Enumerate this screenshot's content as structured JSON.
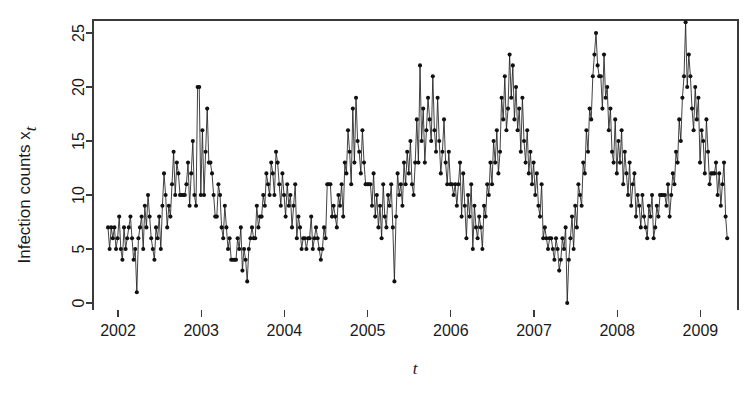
{
  "chart_data": {
    "type": "line",
    "title": "",
    "subtitle": "",
    "xlabel": "t",
    "ylabel": "Infection counts  x",
    "ylabel_subscript": "t",
    "xlim": [
      2002.0,
      2009.05
    ],
    "ylim": [
      0,
      26.5
    ],
    "xticks": [
      2002,
      2003,
      2004,
      2005,
      2006,
      2007,
      2008,
      2009
    ],
    "xticklabels": [
      "2002",
      "2003",
      "2004",
      "2005",
      "2006",
      "2007",
      "2008",
      "2009"
    ],
    "yticks": [
      0,
      5,
      10,
      15,
      20,
      25
    ],
    "yticklabels": [
      "0",
      "5",
      "10",
      "15",
      "20",
      "25"
    ],
    "grid": false,
    "legend": null,
    "marker": "filled-circle",
    "marker_size": 4.1,
    "line_color": "#202020",
    "point_color": "#111111",
    "axis_color": "#3a3a3a",
    "background": "#ffffff",
    "frame": "box",
    "x_start": 2001.88,
    "x_step": 0.019230769,
    "n_points": 371,
    "series": [
      {
        "name": "Infection counts",
        "values": [
          7,
          5,
          7,
          6,
          7,
          5,
          6,
          8,
          5,
          4,
          7,
          5,
          6,
          7,
          8,
          6,
          4,
          5,
          1,
          6,
          7,
          8,
          5,
          9,
          7,
          10,
          8,
          6,
          5,
          4,
          7,
          6,
          8,
          5,
          9,
          12,
          10,
          7,
          9,
          8,
          11,
          14,
          10,
          13,
          12,
          10,
          10,
          10,
          10,
          11,
          13,
          9,
          12,
          15,
          10,
          9,
          20,
          20,
          10,
          16,
          10,
          14,
          18,
          13,
          13,
          12,
          10,
          8,
          8,
          11,
          10,
          7,
          6,
          9,
          7,
          5,
          6,
          4,
          4,
          4,
          4,
          6,
          5,
          7,
          3,
          5,
          4,
          2,
          5,
          6,
          7,
          6,
          6,
          9,
          7,
          8,
          8,
          10,
          9,
          12,
          11,
          10,
          13,
          12,
          10,
          14,
          13,
          11,
          9,
          12,
          10,
          8,
          11,
          9,
          10,
          7,
          9,
          11,
          6,
          8,
          7,
          5,
          6,
          6,
          5,
          6,
          6,
          8,
          5,
          6,
          7,
          6,
          5,
          4,
          5,
          7,
          6,
          11,
          11,
          11,
          8,
          9,
          8,
          7,
          10,
          9,
          11,
          8,
          13,
          12,
          16,
          14,
          11,
          18,
          13,
          19,
          15,
          14,
          12,
          16,
          13,
          11,
          11,
          11,
          11,
          9,
          12,
          8,
          10,
          7,
          9,
          6,
          11,
          8,
          7,
          10,
          9,
          11,
          7,
          2,
          8,
          12,
          10,
          11,
          9,
          13,
          11,
          14,
          12,
          15,
          11,
          10,
          13,
          17,
          13,
          22,
          15,
          18,
          13,
          16,
          19,
          17,
          15,
          21,
          16,
          14,
          19,
          15,
          12,
          14,
          17,
          13,
          11,
          14,
          11,
          11,
          10,
          11,
          9,
          11,
          13,
          8,
          12,
          9,
          6,
          10,
          8,
          11,
          5,
          9,
          7,
          6,
          8,
          7,
          5,
          9,
          8,
          11,
          10,
          13,
          11,
          15,
          13,
          16,
          12,
          14,
          19,
          17,
          21,
          16,
          18,
          23,
          19,
          22,
          17,
          20,
          16,
          18,
          14,
          19,
          15,
          13,
          16,
          12,
          14,
          11,
          13,
          10,
          12,
          9,
          8,
          11,
          6,
          7,
          6,
          5,
          6,
          6,
          5,
          4,
          6,
          5,
          3,
          4,
          6,
          5,
          7,
          0,
          4,
          6,
          8,
          5,
          9,
          7,
          11,
          10,
          9,
          13,
          12,
          16,
          14,
          18,
          17,
          21,
          23,
          25,
          22,
          21,
          21,
          18,
          23,
          19,
          20,
          16,
          18,
          14,
          13,
          17,
          12,
          15,
          13,
          16,
          11,
          14,
          12,
          10,
          13,
          9,
          11,
          12,
          8,
          10,
          9,
          7,
          10,
          8,
          7,
          6,
          9,
          8,
          10,
          6,
          7,
          9,
          8,
          10,
          10,
          10,
          10,
          9,
          11,
          8,
          10,
          12,
          11,
          14,
          13,
          17,
          15,
          19,
          21,
          26,
          20,
          23,
          21,
          18,
          16,
          20,
          17,
          19,
          13,
          16,
          15,
          12,
          17,
          14,
          11,
          12,
          12,
          12,
          13,
          10,
          12,
          9,
          11,
          13,
          8,
          6
        ]
      }
    ]
  },
  "figure": {
    "width": 752,
    "height": 393,
    "plot_box": {
      "left": 93,
      "top": 20,
      "right": 738,
      "bottom": 310
    }
  }
}
